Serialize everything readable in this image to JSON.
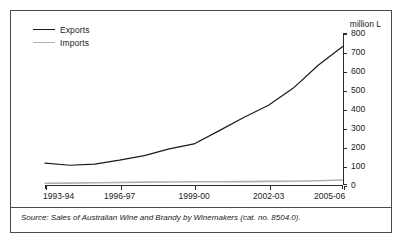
{
  "chart_data": {
    "type": "line",
    "title": "",
    "xlabel": "",
    "ylabel": "million L",
    "unit_caption": "million L",
    "ylim": [
      0,
      800
    ],
    "yticks": [
      0,
      100,
      200,
      300,
      400,
      500,
      600,
      700,
      800
    ],
    "grid": false,
    "legend_position": "top-left",
    "categories": [
      "1993-94",
      "1994-95",
      "1995-96",
      "1996-97",
      "1997-98",
      "1998-99",
      "1999-00",
      "2000-01",
      "2001-02",
      "2002-03",
      "2003-04",
      "2004-05",
      "2005-06"
    ],
    "xtick_labels": [
      "1993-94",
      "1996-97",
      "1999-00",
      "2002-03",
      "2005-06"
    ],
    "xtick_indices": [
      0,
      3,
      6,
      9,
      12
    ],
    "series": [
      {
        "name": "Exports",
        "color": "#1a1a1a",
        "values": [
          115,
          104,
          110,
          131,
          155,
          190,
          216,
          285,
          355,
          420,
          510,
          630,
          730
        ]
      },
      {
        "name": "Imports",
        "color": "#b0b0b0",
        "values": [
          9,
          10,
          12,
          13,
          15,
          16,
          17,
          17,
          18,
          19,
          20,
          22,
          26
        ]
      }
    ]
  },
  "legend": {
    "items": [
      {
        "label": "Exports",
        "color": "#1a1a1a"
      },
      {
        "label": "Imports",
        "color": "#b0b0b0"
      }
    ]
  },
  "footer": {
    "source": "Source: Sales of Australian Wine and Brandy by Winemakers (cat. no. 8504.0)."
  },
  "colors": {
    "exports": "#1a1a1a",
    "imports": "#b0b0b0",
    "axis": "#2b2b2b",
    "frame": "#4a4a4a",
    "text": "#1a1a1a"
  }
}
